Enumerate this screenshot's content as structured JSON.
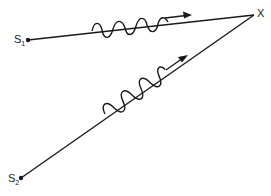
{
  "diagram": {
    "sources": [
      {
        "label": "S",
        "subscript": "1"
      },
      {
        "label": "S",
        "subscript": "2"
      }
    ],
    "target_label": "X",
    "colors": {
      "line": "#1a1a1a",
      "background": "#ffffff"
    }
  }
}
